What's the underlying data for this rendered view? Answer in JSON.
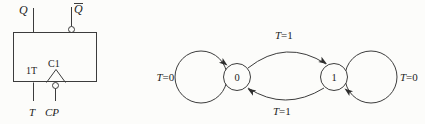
{
  "colors": {
    "stroke": "#3c3c3c",
    "text": "#1c1c1c",
    "background": "#fcfcfa"
  },
  "flip_flop": {
    "output_q_label": "Q",
    "output_qbar_label": "Q",
    "output_qbar_has_overline": true,
    "internal_t_label": "1T",
    "internal_clock_label": "C1",
    "input_t_label": "T",
    "input_cp_label": "CP"
  },
  "state_diagram": {
    "state_0_label": "0",
    "state_1_label": "1",
    "transitions": {
      "loop_0": {
        "var": "T",
        "cond": "=0"
      },
      "loop_1": {
        "var": "T",
        "cond": "=0"
      },
      "zero_to_one": {
        "var": "T",
        "cond": "=1"
      },
      "one_to_zero": {
        "var": "T",
        "cond": "=1"
      }
    }
  }
}
